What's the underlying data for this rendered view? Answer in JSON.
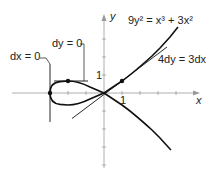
{
  "diagram": {
    "equation": "9y² = x³ + 3x²",
    "tangent_label": "4dy = 3dx",
    "dx_label": "dx = 0",
    "dy_label": "dy = 0",
    "x_axis_label": "x",
    "y_axis_label": "y",
    "x_tick_label": "1",
    "y_tick_label": "1",
    "colors": {
      "curve": "#111111",
      "axis": "#999999",
      "text": "#222222"
    },
    "points": [
      {
        "name": "vertical-tangent-point",
        "x": -3,
        "y": 0
      },
      {
        "name": "horizontal-tangent-point",
        "x": -2,
        "y": 0.667
      },
      {
        "name": "tangent-point",
        "x": 1,
        "y": 0.667
      }
    ]
  }
}
